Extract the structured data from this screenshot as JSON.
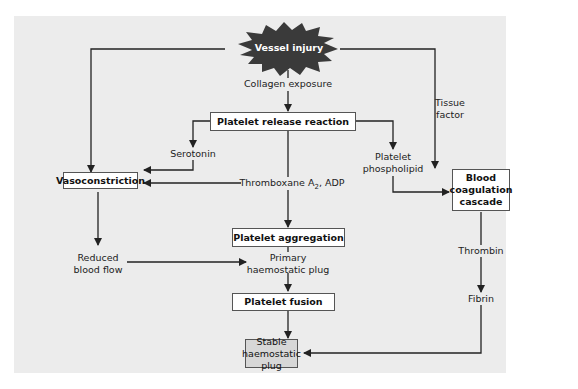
{
  "diagram": {
    "nodes": {
      "vessel_injury": "Vessel injury",
      "platelet_release": "Platelet release reaction",
      "vasoconstriction": "Vasoconstriction",
      "platelet_aggregation": "Platelet aggregation",
      "platelet_fusion": "Platelet fusion",
      "stable_plug": [
        "Stable",
        "haemostatic plug"
      ],
      "coagulation": [
        "Blood",
        "coagulation",
        "cascade"
      ]
    },
    "labels": {
      "collagen": "Collagen exposure",
      "tissue_factor": [
        "Tissue",
        "factor"
      ],
      "serotonin": "Serotonin",
      "thromboxane": "Thromboxane A",
      "thromboxane_sub": "2",
      "thromboxane_tail": ", ADP",
      "phospholipid": [
        "Platelet",
        "phospholipid"
      ],
      "reduced_flow": [
        "Reduced",
        "blood flow"
      ],
      "primary_plug": [
        "Primary",
        "haemostatic plug"
      ],
      "thrombin": "Thrombin",
      "fibrin": "Fibrin"
    },
    "colors": {
      "panel": "#ececec",
      "starburst": "#3a3a3a",
      "final_box": "#d7d7d7",
      "line": "#222222"
    }
  }
}
